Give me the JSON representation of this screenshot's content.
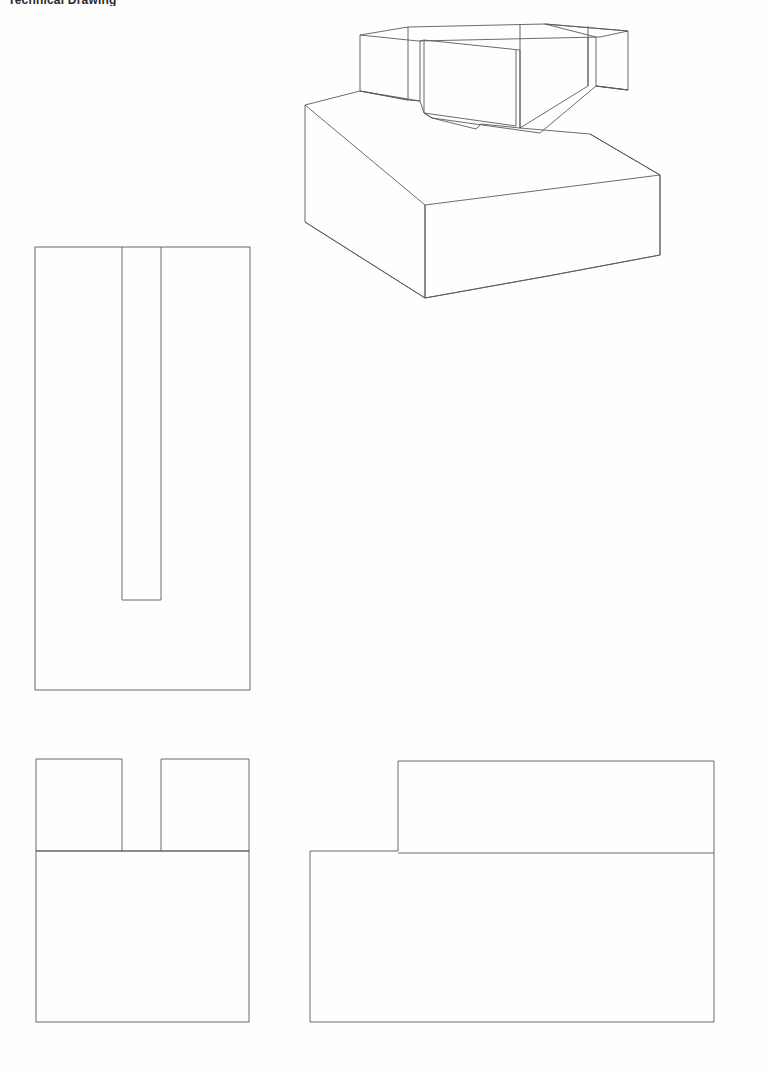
{
  "document": {
    "title_partial": "Technical Drawing",
    "sheet_background": "#fefefe",
    "line_color": "#555555",
    "line_color_dark": "#333333",
    "width_px": 772,
    "height_px": 1069
  },
  "views": {
    "isometric": {
      "name": "Isometric Pictorial View",
      "label": "3D wireframe of slotted stepped block",
      "bounds": {
        "x": 300,
        "y": 20,
        "w": 320,
        "h": 290
      }
    },
    "top": {
      "name": "Top View",
      "label": "Plan view showing open-ended U slot",
      "bounds": {
        "x": 35,
        "y": 247,
        "w": 215,
        "h": 443
      },
      "slot": {
        "left": 122,
        "right": 161,
        "bottom": 600
      }
    },
    "front": {
      "name": "Front View",
      "label": "Front elevation with two raised tabs and central gap",
      "bounds": {
        "x": 36,
        "y": 759,
        "w": 213,
        "h": 263
      },
      "step_line_y": 851,
      "gap": {
        "left": 122,
        "right": 161
      }
    },
    "right": {
      "name": "Right Side View",
      "label": "Side elevation showing L-shaped step profile",
      "bounds": {
        "x": 310,
        "y": 761,
        "w": 404,
        "h": 261
      },
      "step_corner_x": 398,
      "step_line_y": 851
    }
  },
  "geometry": {
    "isometric_outline": "M 353,36 L 404,28 L 540,14 L 620,24 L 628,30 L 628,40 L 522,52 L 522,60 L 470,68",
    "part_description": "Rectangular base block with a raised upper rail containing a through slot",
    "projection": "Third angle orthographic with isometric pictorial"
  }
}
